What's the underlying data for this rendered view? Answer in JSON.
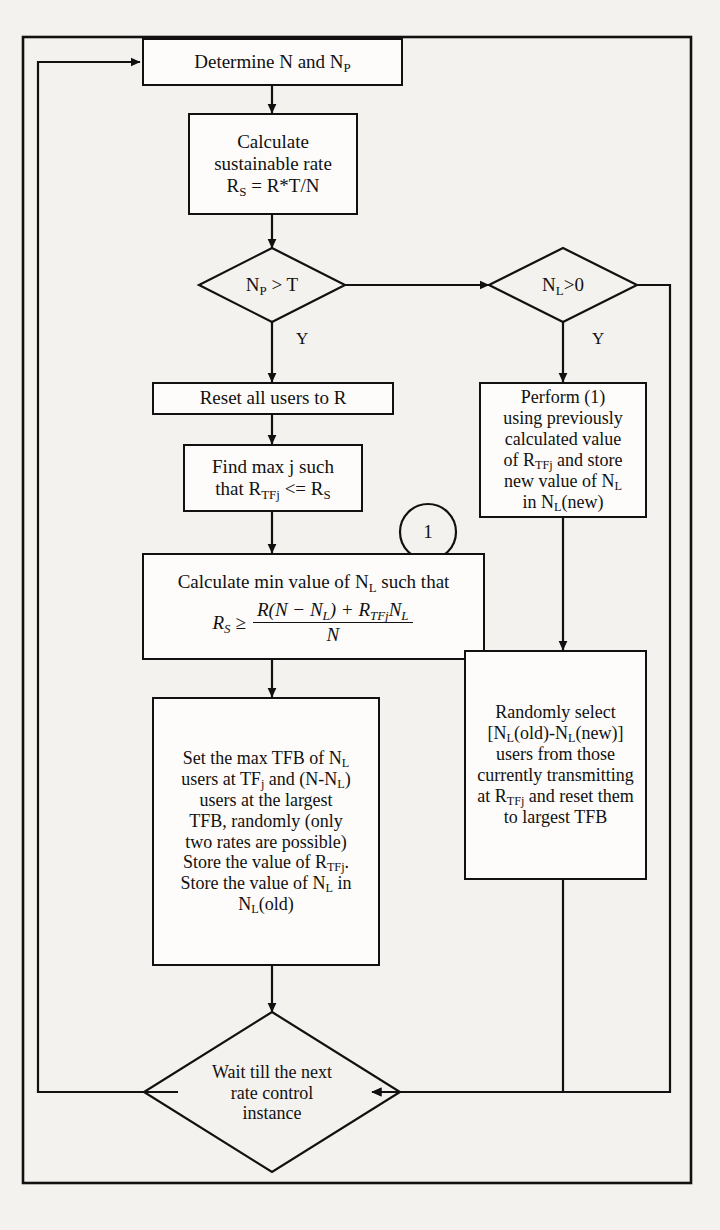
{
  "figure": {
    "type": "flowchart",
    "border": "outer rectangle frame",
    "line_color": "#111111",
    "background_color": "#f4f2ee",
    "node_fill": "#fdfcfa"
  },
  "nodes": {
    "determine": {
      "shape": "process",
      "text": "Determine N and N",
      "sub": "P"
    },
    "calculate_rate": {
      "shape": "process",
      "line1": "Calculate",
      "line2": "sustainable rate",
      "line3_lead": "R",
      "line3_sub": "S",
      "line3_rest": " = R*T/N"
    },
    "decision_np": {
      "shape": "decision",
      "lead": "N",
      "sub": "P",
      "rest": " > T"
    },
    "decision_nl": {
      "shape": "decision",
      "lead": "N",
      "sub": "L",
      "rest": ">0"
    },
    "reset_users": {
      "shape": "process",
      "text": "Reset all users to R"
    },
    "find_max_j": {
      "shape": "process",
      "line1": "Find max j such",
      "line2_lead": "that R",
      "line2_sub": "TFj",
      "line2_mid": " <= R",
      "line2_sub2": "S"
    },
    "perform_1": {
      "shape": "process",
      "line1": "Perform (1)",
      "line2": "using previously",
      "line3": "calculated value",
      "line4_lead": "of R",
      "line4_sub": "TFj",
      "line4_rest": " and store",
      "line5_lead": "new value of N",
      "line5_sub": "L",
      "line6_lead": "in N",
      "line6_sub": "L",
      "line6_rest": "(new)"
    },
    "calc_min_nl": {
      "shape": "process",
      "heading_lead": "Calculate min value of N",
      "heading_sub": "L",
      "heading_rest": " such that",
      "equation": {
        "lhs_lead": "R",
        "lhs_sub": "S",
        "relation": "≥",
        "numerator_a": "R(N − N",
        "numerator_a_sub": "L",
        "numerator_b": ") + R",
        "numerator_b_sub": "TFj",
        "numerator_c": "N",
        "numerator_c_sub": "L",
        "denominator": "N"
      }
    },
    "set_max_tfb": {
      "shape": "process",
      "line1_lead": "Set the max TFB of N",
      "line1_sub": "L",
      "line2_lead": "users at TF",
      "line2_sub": "j",
      "line2_mid": " and (N-N",
      "line2_sub2": "L",
      "line2_rest": ")",
      "line3": "users at the largest",
      "line4": "TFB, randomly (only",
      "line5": "two rates are possible)",
      "line6_lead": "Store the value of R",
      "line6_sub": "TFj",
      "line6_rest": ".",
      "line7_lead": "Store the value of N",
      "line7_sub": "L",
      "line7_rest": " in",
      "line8_lead": "N",
      "line8_sub": "L",
      "line8_rest": "(old)"
    },
    "randomly_select": {
      "shape": "process",
      "line1": "Randomly select",
      "line2_lead": "[N",
      "line2_sub": "L",
      "line2_mid": "(old)-N",
      "line2_sub2": "L",
      "line2_rest": "(new)]",
      "line3": "users from those",
      "line4": "currently transmitting",
      "line5_lead": "at R",
      "line5_sub": "TFj",
      "line5_rest": " and reset them",
      "line6": "to largest TFB"
    },
    "wait": {
      "shape": "decision",
      "line1": "Wait till the next",
      "line2": "rate control",
      "line3": "instance"
    },
    "connector_1": {
      "shape": "circle-connector",
      "text": "1"
    }
  },
  "branch_labels": {
    "np_yes": "Y",
    "nl_yes": "Y"
  }
}
